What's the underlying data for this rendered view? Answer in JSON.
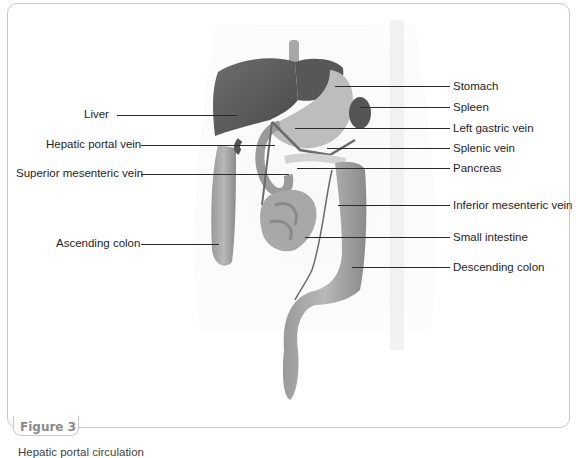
{
  "figure": {
    "label": "Figure 3",
    "caption": "Hepatic portal circulation"
  },
  "labels": {
    "left": [
      {
        "text": "Liver",
        "y": 115
      },
      {
        "text": "Hepatic portal vein",
        "y": 145
      },
      {
        "text": "Superior mesenteric vein",
        "y": 174
      },
      {
        "text": "Ascending colon",
        "y": 244
      }
    ],
    "right": [
      {
        "text": "Stomach",
        "y": 86
      },
      {
        "text": "Spleen",
        "y": 107
      },
      {
        "text": "Left gastric vein",
        "y": 128
      },
      {
        "text": "Splenic vein",
        "y": 148
      },
      {
        "text": "Pancreas",
        "y": 168
      },
      {
        "text": "Inferior mesenteric vein",
        "y": 205
      },
      {
        "text": "Small intestine",
        "y": 237
      },
      {
        "text": "Descending colon",
        "y": 267
      }
    ]
  },
  "colors": {
    "organ_dark": "#5a5a5a",
    "organ_mid": "#8e8e8e",
    "organ_light": "#b5b5b5",
    "frame": "#c8c8c8",
    "leader": "#2a2a2a"
  }
}
